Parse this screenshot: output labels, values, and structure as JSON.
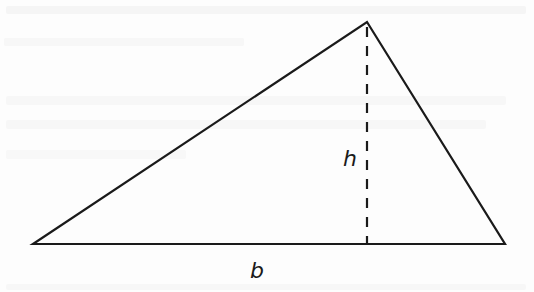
{
  "figure": {
    "type": "triangle-area-diagram",
    "labels": {
      "height": "h",
      "base": "b"
    },
    "vertices": {
      "left": [
        33,
        244
      ],
      "apex": [
        367,
        22
      ],
      "right": [
        505,
        244
      ]
    },
    "altitude": {
      "x": 367,
      "y_top": 27,
      "y_bottom": 244,
      "style": "dashed"
    },
    "colors": {
      "stroke": "#1a1a1a",
      "background": "#fdfdfd"
    }
  }
}
